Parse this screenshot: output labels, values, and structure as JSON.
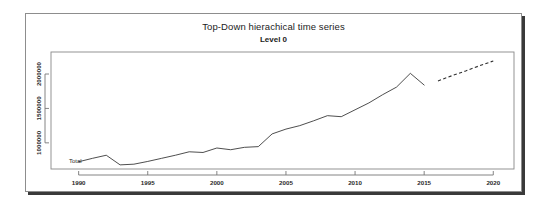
{
  "figure": {
    "title": "Top-Down hierachical time series",
    "subtitle": "Level 0",
    "series_label": "Total"
  },
  "chart_data": {
    "type": "line",
    "title": "Top-Down hierachical time series",
    "subtitle": "Level 0",
    "xlabel": "",
    "ylabel": "",
    "xlim": [
      1988.0,
      2021.5
    ],
    "ylim": [
      620000,
      2320000
    ],
    "grid": false,
    "legend": "none",
    "annotations": [
      {
        "text": "Total",
        "x": 1989.3,
        "y": 700000
      }
    ],
    "xticks": [
      1990,
      1995,
      2000,
      2005,
      2010,
      2015,
      2020
    ],
    "xtick_labels": [
      "1990",
      "1995",
      "2000",
      "2005",
      "2010",
      "2015",
      "2020"
    ],
    "yticks": [
      1000000,
      1500000,
      2000000
    ],
    "ytick_labels": [
      "1000000",
      "1500000",
      "2000000"
    ],
    "series": [
      {
        "name": "Total",
        "style": "solid",
        "x": [
          1990,
          1991,
          1992,
          1993,
          1994,
          1995,
          1996,
          1997,
          1998,
          1999,
          2000,
          2001,
          2002,
          2003,
          2004,
          2005,
          2006,
          2007,
          2008,
          2009,
          2010,
          2011,
          2012,
          2013,
          2014,
          2015
        ],
        "values": [
          725000,
          775000,
          820000,
          680000,
          690000,
          730000,
          775000,
          820000,
          870000,
          860000,
          925000,
          900000,
          935000,
          945000,
          1130000,
          1200000,
          1250000,
          1320000,
          1395000,
          1380000,
          1480000,
          1580000,
          1700000,
          1810000,
          2010000,
          1840000
        ]
      },
      {
        "name": "Forecast",
        "style": "dashed",
        "x": [
          2016,
          2017,
          2018,
          2019,
          2020
        ],
        "values": [
          1900000,
          1975000,
          2045000,
          2120000,
          2190000
        ]
      }
    ]
  }
}
